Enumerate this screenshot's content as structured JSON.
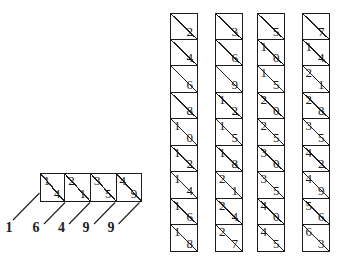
{
  "ink": "#1c1c1c",
  "background": "#ffffff",
  "lattice": {
    "cells": [
      {
        "tens": "1",
        "units": "4"
      },
      {
        "tens": "2",
        "units": "1"
      },
      {
        "tens": "3",
        "units": "5"
      },
      {
        "tens": "4",
        "units": "9"
      }
    ],
    "result_digits": [
      "1",
      "6",
      "4",
      "9",
      "9"
    ]
  },
  "rods": [
    {
      "cells": [
        {
          "tens": "",
          "units": "2"
        },
        {
          "tens": "",
          "units": "4"
        },
        {
          "tens": "",
          "units": "6"
        },
        {
          "tens": "",
          "units": "8"
        },
        {
          "tens": "1",
          "units": "0"
        },
        {
          "tens": "1",
          "units": "2"
        },
        {
          "tens": "1",
          "units": "4"
        },
        {
          "tens": "1",
          "units": "6"
        },
        {
          "tens": "1",
          "units": "8"
        }
      ]
    },
    {
      "cells": [
        {
          "tens": "",
          "units": "3"
        },
        {
          "tens": "",
          "units": "6"
        },
        {
          "tens": "",
          "units": "9"
        },
        {
          "tens": "1",
          "units": "2"
        },
        {
          "tens": "1",
          "units": "5"
        },
        {
          "tens": "1",
          "units": "8"
        },
        {
          "tens": "2",
          "units": "1"
        },
        {
          "tens": "2",
          "units": "4"
        },
        {
          "tens": "2",
          "units": "7"
        }
      ]
    },
    {
      "cells": [
        {
          "tens": "",
          "units": "5"
        },
        {
          "tens": "1",
          "units": "0"
        },
        {
          "tens": "1",
          "units": "5"
        },
        {
          "tens": "2",
          "units": "0"
        },
        {
          "tens": "2",
          "units": "5"
        },
        {
          "tens": "3",
          "units": "0"
        },
        {
          "tens": "3",
          "units": "5"
        },
        {
          "tens": "4",
          "units": "0"
        },
        {
          "tens": "4",
          "units": "5"
        }
      ]
    },
    {
      "cells": [
        {
          "tens": "",
          "units": "7"
        },
        {
          "tens": "1",
          "units": "4"
        },
        {
          "tens": "2",
          "units": "1"
        },
        {
          "tens": "2",
          "units": "8"
        },
        {
          "tens": "3",
          "units": "5"
        },
        {
          "tens": "4",
          "units": "2"
        },
        {
          "tens": "4",
          "units": "9"
        },
        {
          "tens": "5",
          "units": "6"
        },
        {
          "tens": "6",
          "units": "3"
        }
      ]
    }
  ]
}
